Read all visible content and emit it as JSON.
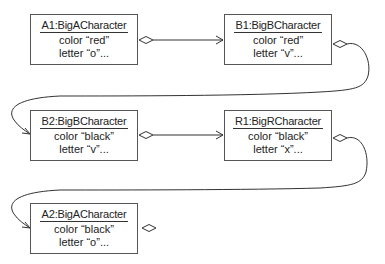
{
  "diagram": {
    "type": "UML object diagram",
    "objects": [
      {
        "id": "A1",
        "name": "A1:BigACharacter",
        "color": "color “red”",
        "letter": "letter “o”..."
      },
      {
        "id": "B1",
        "name": "B1:BigBCharacter",
        "color": "color “red”",
        "letter": "letter “v”..."
      },
      {
        "id": "B2",
        "name": "B2:BigBCharacter",
        "color": "color “black”",
        "letter": "letter “v”..."
      },
      {
        "id": "R1",
        "name": "R1:BigRCharacter",
        "color": "color “black”",
        "letter": "letter “x”..."
      },
      {
        "id": "A2",
        "name": "A2:BigACharacter",
        "color": "color “black”",
        "letter": "letter “o”..."
      }
    ],
    "links": [
      {
        "from": "A1",
        "to": "B1",
        "kind": "aggregation"
      },
      {
        "from": "B1",
        "to": "B2",
        "kind": "aggregation"
      },
      {
        "from": "B2",
        "to": "R1",
        "kind": "aggregation"
      },
      {
        "from": "R1",
        "to": "A2",
        "kind": "aggregation"
      },
      {
        "from": "A2",
        "to": null,
        "kind": "aggregation"
      }
    ],
    "colors": {
      "line": "#333333",
      "box_border": "#555555",
      "text": "#222222"
    }
  }
}
